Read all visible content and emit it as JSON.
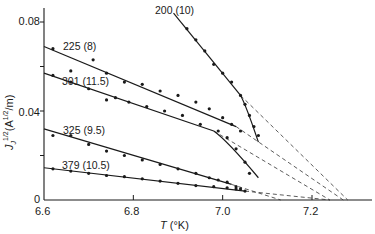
{
  "chart_data": {
    "type": "line",
    "title": "",
    "xlabel": "T (°K)",
    "ylabel": "J_J^1/2 (A^1/2/m)",
    "xlim": [
      6.6,
      7.35
    ],
    "ylim": [
      0,
      0.09
    ],
    "x_ticks": [
      "6.6",
      "6.8",
      "7.0",
      "7.2"
    ],
    "y_ticks": [
      "0",
      "0.04",
      "0.08"
    ],
    "y_minor_ticks": [
      0.02,
      0.06
    ],
    "grid": false,
    "legend": null,
    "series": [
      {
        "name": "200 (10)",
        "label_pos": [
          6.94,
          0.086
        ],
        "points": [
          [
            6.92,
            0.077
          ],
          [
            6.94,
            0.072
          ],
          [
            6.96,
            0.067
          ],
          [
            6.98,
            0.061
          ],
          [
            7.0,
            0.057
          ],
          [
            7.02,
            0.053
          ],
          [
            7.04,
            0.047
          ],
          [
            7.05,
            0.043
          ],
          [
            7.06,
            0.038
          ],
          [
            7.07,
            0.033
          ],
          [
            7.08,
            0.029
          ]
        ],
        "fit_line": [
          [
            6.89,
            0.084
          ],
          [
            7.04,
            0.047
          ]
        ],
        "curve_end": [
          7.08,
          0.026
        ],
        "extrapolation_intercept": 7.28
      },
      {
        "name": "225 (8)",
        "label_pos": [
          6.63,
          0.071
        ],
        "points": [
          [
            6.62,
            0.068
          ],
          [
            6.66,
            0.058
          ],
          [
            6.71,
            0.063
          ],
          [
            6.74,
            0.057
          ],
          [
            6.78,
            0.053
          ],
          [
            6.82,
            0.052
          ],
          [
            6.86,
            0.049
          ],
          [
            6.9,
            0.047
          ],
          [
            6.94,
            0.044
          ],
          [
            6.97,
            0.041
          ],
          [
            7.0,
            0.037
          ],
          [
            7.02,
            0.034
          ],
          [
            7.04,
            0.031
          ]
        ],
        "fit_line": [
          [
            6.6,
            0.069
          ],
          [
            7.03,
            0.033
          ]
        ],
        "extrapolation_intercept": 7.27
      },
      {
        "name": "301 (11.5)",
        "label_pos": [
          6.63,
          0.058
        ],
        "points": [
          [
            6.62,
            0.056
          ],
          [
            6.66,
            0.053
          ],
          [
            6.7,
            0.05
          ],
          [
            6.74,
            0.045
          ],
          [
            6.76,
            0.046
          ],
          [
            6.79,
            0.044
          ],
          [
            6.83,
            0.042
          ],
          [
            6.87,
            0.04
          ],
          [
            6.91,
            0.038
          ],
          [
            6.95,
            0.034
          ],
          [
            6.99,
            0.031
          ],
          [
            7.01,
            0.028
          ],
          [
            7.03,
            0.023
          ],
          [
            7.05,
            0.017
          ],
          [
            7.06,
            0.012
          ]
        ],
        "fit_line": [
          [
            6.6,
            0.057
          ],
          [
            6.98,
            0.031
          ]
        ],
        "curve_end": [
          7.08,
          0.01
        ],
        "extrapolation_intercept": 7.24
      },
      {
        "name": "325 (9.5)",
        "label_pos": [
          6.64,
          0.034
        ],
        "points": [
          [
            6.62,
            0.029
          ],
          [
            6.66,
            0.029
          ],
          [
            6.7,
            0.025
          ],
          [
            6.74,
            0.022
          ],
          [
            6.78,
            0.02
          ],
          [
            6.82,
            0.018
          ],
          [
            6.86,
            0.016
          ],
          [
            6.9,
            0.014
          ],
          [
            6.94,
            0.012
          ],
          [
            6.97,
            0.01
          ],
          [
            6.99,
            0.009
          ],
          [
            7.01,
            0.008
          ],
          [
            7.03,
            0.006
          ],
          [
            7.04,
            0.005
          ]
        ],
        "fit_line": [
          [
            6.6,
            0.032
          ],
          [
            7.02,
            0.007
          ]
        ],
        "extrapolation_intercept": 7.13
      },
      {
        "name": "379 (10.5)",
        "label_pos": [
          6.64,
          0.018
        ],
        "points": [
          [
            6.62,
            0.014
          ],
          [
            6.66,
            0.013
          ],
          [
            6.7,
            0.012
          ],
          [
            6.74,
            0.011
          ],
          [
            6.78,
            0.0105
          ],
          [
            6.82,
            0.0095
          ],
          [
            6.86,
            0.0085
          ],
          [
            6.9,
            0.0075
          ],
          [
            6.94,
            0.0065
          ],
          [
            6.98,
            0.006
          ],
          [
            7.01,
            0.0055
          ],
          [
            7.03,
            0.005
          ],
          [
            7.05,
            0.004
          ]
        ],
        "fit_line": [
          [
            6.6,
            0.0145
          ],
          [
            7.05,
            0.004
          ]
        ],
        "extrapolation_intercept": 7.24
      }
    ]
  },
  "axis": {
    "x_title_T": "T",
    "x_title_unit": "(°K)",
    "y_title": "J",
    "y_tick_labels": [
      "0.08",
      "0.04",
      "0"
    ],
    "x_tick_labels": [
      "6.6",
      "6.8",
      "7.0",
      "7.2"
    ]
  },
  "labels": {
    "s200": "200 (10)",
    "s225": "225 (8)",
    "s301": "301 (11.5)",
    "s325": "325 (9.5)",
    "s379": "379 (10.5)"
  }
}
